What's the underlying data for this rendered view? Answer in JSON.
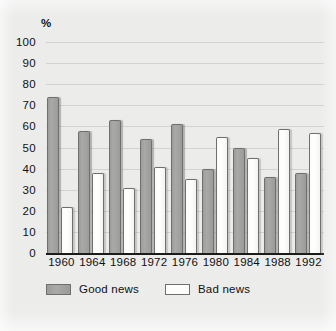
{
  "chart_data": {
    "type": "bar",
    "title": "",
    "subtitle": "",
    "xlabel": "",
    "ylabel": "%",
    "ylim": [
      0,
      100
    ],
    "ytick_step": 10,
    "yticks": [
      100,
      90,
      80,
      70,
      60,
      50,
      40,
      30,
      20,
      10,
      0
    ],
    "grid": true,
    "legend_position": "bottom-left",
    "categories": [
      "1960",
      "1964",
      "1968",
      "1972",
      "1976",
      "1980",
      "1984",
      "1988",
      "1992"
    ],
    "series": [
      {
        "name": "Good news",
        "color": "#a3a3a1",
        "values": [
          74,
          58,
          63,
          54,
          61,
          40,
          50,
          36,
          38
        ]
      },
      {
        "name": "Bad news",
        "color": "#fdfdfc",
        "values": [
          22,
          38,
          31,
          41,
          35,
          55,
          45,
          59,
          57
        ]
      }
    ]
  },
  "axis": {
    "unit_label": "%"
  },
  "legend": {
    "items": [
      {
        "label": "Good news",
        "swatch": "good"
      },
      {
        "label": "Bad news",
        "swatch": "bad"
      }
    ]
  },
  "colors": {
    "background": "#ececeb",
    "gridline": "#d2d2d0",
    "baseline": "#1a1a1a",
    "bar_good": "#a3a3a1",
    "bar_bad": "#fdfdfc",
    "bar_outline": "#6f6f6d",
    "text": "#111111"
  }
}
